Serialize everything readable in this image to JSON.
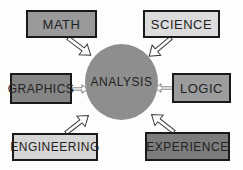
{
  "diagram": {
    "center": {
      "label": "ANALYSIS",
      "fill": "#8e8e8e"
    },
    "nodes": [
      {
        "id": "math",
        "label": "MATH",
        "fill": "#9a9a9a",
        "x": 26,
        "y": 10,
        "w": 71,
        "h": 28
      },
      {
        "id": "science",
        "label": "SCIENCE",
        "fill": "#dcdcdc",
        "x": 143,
        "y": 10,
        "w": 77,
        "h": 28
      },
      {
        "id": "graphics",
        "label": "GRAPHICS",
        "fill": "#858585",
        "x": 10,
        "y": 73,
        "w": 62,
        "h": 31
      },
      {
        "id": "logic",
        "label": "LOGIC",
        "fill": "#9c9c9c",
        "x": 172,
        "y": 73,
        "w": 59,
        "h": 30
      },
      {
        "id": "engineering",
        "label": "ENGINEERING",
        "fill": "#d6d6d6",
        "x": 12,
        "y": 133,
        "w": 86,
        "h": 28
      },
      {
        "id": "experience",
        "label": "EXPERIENCE",
        "fill": "#7c7c7c",
        "x": 145,
        "y": 132,
        "w": 85,
        "h": 29
      }
    ],
    "edges": [
      {
        "from": "math",
        "to": "analysis"
      },
      {
        "from": "science",
        "to": "analysis"
      },
      {
        "from": "graphics",
        "to": "analysis"
      },
      {
        "from": "logic",
        "to": "analysis"
      },
      {
        "from": "engineering",
        "to": "analysis"
      },
      {
        "from": "experience",
        "to": "analysis"
      }
    ]
  }
}
